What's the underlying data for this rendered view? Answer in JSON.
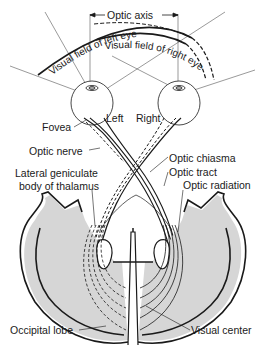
{
  "figure": {
    "type": "anatomical-diagram"
  },
  "labels": {
    "optic_axis": "Optic axis",
    "visual_field_left": "Visual field of left eye",
    "visual_field_right": "Visual field of right eye",
    "left": "Left",
    "right": "Right",
    "fovea": "Fovea",
    "optic_nerve": "Optic nerve",
    "lateral_geniculate_line1": "Lateral geniculate",
    "lateral_geniculate_line2": "body of thalamus",
    "optic_chiasma": "Optic chiasma",
    "optic_tract": "Optic tract",
    "optic_radiation": "Optic radiation",
    "occipital_lobe": "Occipital lobe",
    "visual_center": "Visual center"
  },
  "colors": {
    "line": "#1a1a1a",
    "cortex_shade": "#b8b8b8",
    "background": "#ffffff"
  }
}
